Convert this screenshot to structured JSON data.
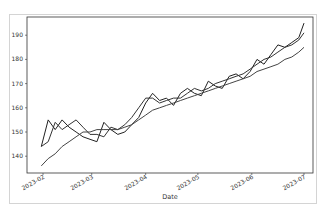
{
  "chart_data": {
    "type": "line",
    "title": "",
    "xlabel": "Date",
    "ylabel": "",
    "ylim": [
      133,
      196
    ],
    "yticks": [
      140,
      150,
      160,
      170,
      180,
      190
    ],
    "xticks": [
      "2023-02",
      "2023-03",
      "2023-04",
      "2023-05",
      "2023-06",
      "2023-07"
    ],
    "grid": false,
    "legend": null,
    "x": [
      "2023-01-31",
      "2023-02-04",
      "2023-02-08",
      "2023-02-12",
      "2023-02-16",
      "2023-02-20",
      "2023-02-24",
      "2023-02-28",
      "2023-03-04",
      "2023-03-08",
      "2023-03-12",
      "2023-03-16",
      "2023-03-20",
      "2023-03-24",
      "2023-03-28",
      "2023-04-01",
      "2023-04-05",
      "2023-04-09",
      "2023-04-13",
      "2023-04-17",
      "2023-04-21",
      "2023-04-25",
      "2023-04-29",
      "2023-05-03",
      "2023-05-07",
      "2023-05-11",
      "2023-05-15",
      "2023-05-19",
      "2023-05-23",
      "2023-05-27",
      "2023-05-31",
      "2023-06-04",
      "2023-06-08",
      "2023-06-12",
      "2023-06-16",
      "2023-06-20",
      "2023-06-24",
      "2023-06-28",
      "2023-07-01"
    ],
    "series": [
      {
        "name": "series-1",
        "color": "#222222",
        "values": [
          144,
          155,
          151,
          155,
          152,
          150,
          148,
          147,
          146,
          154,
          151,
          149,
          150,
          153,
          156,
          162,
          166,
          163,
          164,
          161,
          166,
          168,
          166,
          165,
          171,
          169,
          168,
          173,
          174,
          172,
          175,
          180,
          178,
          182,
          186,
          185,
          187,
          189,
          195
        ]
      },
      {
        "name": "series-2",
        "color": "#333333",
        "values": [
          144,
          146,
          154,
          151,
          153,
          155,
          152,
          149,
          149,
          148,
          152,
          151,
          153,
          156,
          160,
          164,
          164,
          162,
          163,
          164,
          164,
          166,
          168,
          167,
          168,
          170,
          171,
          172,
          173,
          174,
          176,
          178,
          180,
          181,
          183,
          185,
          186,
          188,
          191
        ]
      },
      {
        "name": "series-3",
        "color": "#444444",
        "values": [
          136,
          139,
          141,
          144,
          146,
          148,
          150,
          150,
          151,
          151,
          151,
          151,
          152,
          153,
          155,
          157,
          159,
          160,
          161,
          162,
          163,
          164,
          165,
          166,
          167,
          168,
          169,
          170,
          171,
          172,
          173,
          175,
          176,
          177,
          178,
          180,
          181,
          183,
          185
        ]
      }
    ]
  }
}
